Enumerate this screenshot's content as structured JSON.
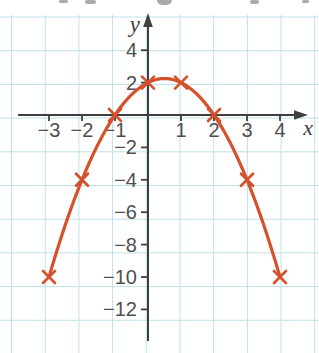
{
  "chart_data": {
    "type": "line",
    "title": "",
    "xlabel": "x",
    "ylabel": "y",
    "grid": true,
    "legend": false,
    "marker": "x",
    "points": [
      {
        "x": -3,
        "y": -10
      },
      {
        "x": -2,
        "y": -4
      },
      {
        "x": -1,
        "y": 0
      },
      {
        "x": 0,
        "y": 2
      },
      {
        "x": 1,
        "y": 2
      },
      {
        "x": 2,
        "y": 0
      },
      {
        "x": 3,
        "y": -4
      },
      {
        "x": 4,
        "y": -10
      }
    ],
    "curve": {
      "kind": "quadratic",
      "a": -1,
      "b": 1,
      "c": 2,
      "x_min": -3,
      "x_max": 4
    },
    "x_ticks": [
      {
        "value": -3,
        "label": "−3"
      },
      {
        "value": -2,
        "label": "−2"
      },
      {
        "value": -1,
        "label": "−1"
      },
      {
        "value": 1,
        "label": "1"
      },
      {
        "value": 2,
        "label": "2"
      },
      {
        "value": 3,
        "label": "3"
      },
      {
        "value": 4,
        "label": "4"
      }
    ],
    "y_ticks": [
      {
        "value": 4,
        "label": "4"
      },
      {
        "value": 2,
        "label": "2"
      },
      {
        "value": -2,
        "label": "−2"
      },
      {
        "value": -4,
        "label": "−4"
      },
      {
        "value": -6,
        "label": "−6"
      },
      {
        "value": -8,
        "label": "−8"
      },
      {
        "value": -10,
        "label": "−10"
      },
      {
        "value": -12,
        "label": "−12"
      }
    ],
    "axis_range": {
      "x": [
        -4,
        5
      ],
      "y": [
        -14.5,
        6.3
      ]
    },
    "colors": {
      "curve": "#d5512b",
      "axis": "#3f3f3f",
      "tick_text": "#4f4f4f",
      "grid": "#bfe2e7",
      "background": "#ffffff"
    }
  }
}
